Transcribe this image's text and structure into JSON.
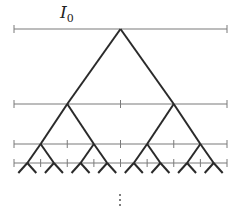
{
  "diagram": {
    "title_label": {
      "main": "I",
      "sub": "0"
    },
    "continuation": "⋮",
    "levels": [
      {
        "y": 29,
        "segments": 1
      },
      {
        "y": 104,
        "segments": 2
      },
      {
        "y": 144,
        "segments": 4
      },
      {
        "y": 163,
        "segments": 8
      }
    ],
    "x_range": [
      14,
      227
    ],
    "leaf_bottom": 173,
    "colors": {
      "interval": "#7a7a7a",
      "tree": "#2a2a2a"
    }
  }
}
